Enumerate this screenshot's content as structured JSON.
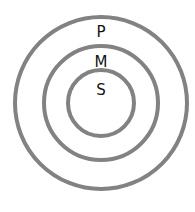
{
  "diagram": {
    "type": "concentric-circles",
    "stroke_color": "#828282",
    "label_color": "#111111",
    "center": [
      101,
      103
    ],
    "rings": [
      {
        "label": "P",
        "radius": 86,
        "label_y": 34
      },
      {
        "label": "M",
        "radius": 57,
        "label_y": 64
      },
      {
        "label": "S",
        "radius": 33,
        "label_y": 94
      }
    ]
  }
}
